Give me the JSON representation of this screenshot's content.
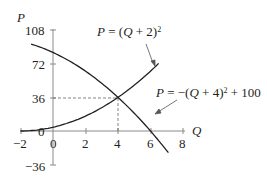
{
  "chart_data": {
    "type": "line",
    "title": "",
    "xlabel": "Q",
    "ylabel": "P",
    "xlim": [
      -2,
      8
    ],
    "ylim": [
      -36,
      108
    ],
    "x_ticks": [
      "-2",
      "0",
      "2",
      "4",
      "6",
      "8"
    ],
    "y_ticks": [
      "108",
      "72",
      "36",
      "0",
      "-36"
    ],
    "grid": false,
    "series": [
      {
        "name": "P = (Q + 2)^2",
        "label_display": {
          "lhs": "P",
          "eq": " = (",
          "var": "Q",
          "rest": " + 2)",
          "exp": "2"
        },
        "x": [
          -2,
          -1,
          0,
          1,
          2,
          3,
          4,
          5,
          6,
          7
        ],
        "values": [
          0,
          1,
          4,
          9,
          16,
          25,
          36,
          49,
          64,
          81
        ]
      },
      {
        "name": "P = -(Q + 4)^2 + 100",
        "label_display": {
          "lhs": "P",
          "eq": " = −(",
          "var": "Q",
          "rest": " + 4)",
          "exp": "2",
          "tail": " + 100"
        },
        "x": [
          -2,
          -1,
          0,
          1,
          2,
          3,
          4,
          5,
          6,
          7
        ],
        "values": [
          96,
          91,
          84,
          75,
          64,
          51,
          36,
          19,
          0,
          -21
        ]
      }
    ],
    "annotations": [
      {
        "type": "dashed-guide",
        "point": [
          4,
          36
        ],
        "text": "equilibrium at Q = 4, P = 36"
      }
    ]
  },
  "axis": {
    "y_label": "P",
    "x_label": "Q",
    "y_tick_labels": {
      "t108": "108",
      "t72": "72",
      "t36": "36",
      "t0": "0",
      "tm36": "−36"
    },
    "x_tick_labels": {
      "tm2": "−2",
      "t0": "0",
      "t2": "2",
      "t4": "4",
      "t6": "6",
      "t8": "8"
    }
  }
}
